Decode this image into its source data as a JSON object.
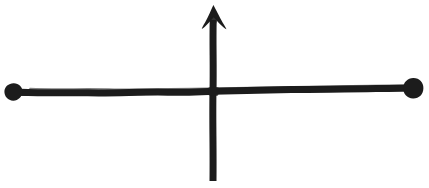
{
  "figure": {
    "background_color": "#ffffff",
    "ink_color": "#1c1c1c",
    "canvas": {
      "width": 429,
      "height": 188
    },
    "style": "hand-drawn marker / pen sketch, rough wobbly strokes"
  },
  "elements": {
    "horizontal_segment": {
      "name": "horizontal-line",
      "start_x": 13,
      "start_y": 92,
      "end_x": 413,
      "end_y": 88,
      "stroke_width": 7,
      "note": "slight upward slope toward the right, wobbly hand-drawn edge"
    },
    "left_endpoint_dot": {
      "name": "left-endpoint-dot",
      "center_x": 13,
      "center_y": 92,
      "radius": 9,
      "filled": true
    },
    "right_endpoint_dot": {
      "name": "right-endpoint-dot",
      "center_x": 413,
      "center_y": 88,
      "radius": 10,
      "filled": true
    },
    "vertical_arrow": {
      "name": "vertical-arrow",
      "shaft_x": 213,
      "shaft_top_y": 20,
      "shaft_bottom_y": 181,
      "stroke_width": 7,
      "arrow_tip_x": 213,
      "arrow_tip_y": 5,
      "arrow_head_left_x": 202,
      "arrow_head_right_x": 226,
      "arrow_head_base_y": 29,
      "direction": "up"
    },
    "intersection": {
      "name": "intersection-point",
      "x": 213,
      "y": 91
    }
  },
  "labels": {
    "text_present": "none",
    "count": 0
  }
}
